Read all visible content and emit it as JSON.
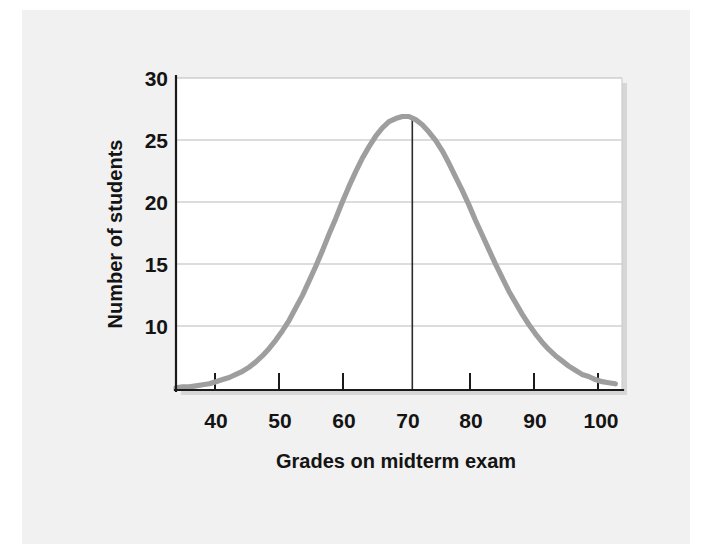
{
  "figure": {
    "background_color": "#f1f1f1",
    "plot_background_color": "#ffffff",
    "curve_color": "#9e9e9e",
    "grid_color": "#b9b9b9",
    "axis_color": "#1a1a1a",
    "text_color": "#141414"
  },
  "chart_data": {
    "type": "line",
    "title": "",
    "subtitle": "",
    "xlabel": "Grades on midterm exam",
    "ylabel": "Number of students",
    "xlim": [
      35,
      102
    ],
    "ylim": [
      0,
      30
    ],
    "xticks": [
      40,
      50,
      60,
      70,
      80,
      90,
      100
    ],
    "xtick_labels": [
      "40",
      "50",
      "60",
      "70",
      "80",
      "90",
      "100"
    ],
    "yticks": [
      10,
      15,
      20,
      25,
      30
    ],
    "ytick_labels": [
      "10",
      "15",
      "20",
      "25",
      "30"
    ],
    "grid": "horizontal",
    "legend": "none",
    "annotations": [
      {
        "name": "mean-marker",
        "type": "vline",
        "x": 70.5,
        "y_from": 0,
        "y_to": 26.3,
        "label": ""
      }
    ],
    "series": [
      {
        "name": "Normal distribution of grades",
        "color": "#9e9e9e",
        "peak_x": 70.5,
        "peak_y": 26.3,
        "sigma": 11.0,
        "x": [
          35,
          36,
          37,
          38,
          39,
          40,
          41,
          42,
          43,
          44,
          45,
          46,
          47,
          48,
          49,
          50,
          51,
          52,
          53,
          54,
          55,
          56,
          57,
          58,
          59,
          60,
          61,
          62,
          63,
          64,
          65,
          66,
          67,
          68,
          69,
          70,
          71,
          72,
          73,
          74,
          75,
          76,
          77,
          78,
          79,
          80,
          81,
          82,
          83,
          84,
          85,
          86,
          87,
          88,
          89,
          90,
          91,
          92,
          93,
          94,
          95,
          96,
          97,
          98,
          99,
          100,
          101
        ],
        "values": [
          0.2,
          0.3,
          0.3,
          0.4,
          0.5,
          0.6,
          0.8,
          1.0,
          1.2,
          1.5,
          1.8,
          2.2,
          2.7,
          3.3,
          4.0,
          4.8,
          5.7,
          6.7,
          7.9,
          9.1,
          10.5,
          11.9,
          13.4,
          15.0,
          16.5,
          18.1,
          19.6,
          21.0,
          22.3,
          23.4,
          24.4,
          25.2,
          25.8,
          26.1,
          26.3,
          26.3,
          26.0,
          25.5,
          24.8,
          24.0,
          23.0,
          21.8,
          20.5,
          19.2,
          17.8,
          16.3,
          14.9,
          13.5,
          12.1,
          10.8,
          9.5,
          8.4,
          7.3,
          6.3,
          5.4,
          4.6,
          3.9,
          3.3,
          2.8,
          2.3,
          1.9,
          1.5,
          1.3,
          1.0,
          0.8,
          0.7,
          0.6
        ]
      }
    ]
  }
}
